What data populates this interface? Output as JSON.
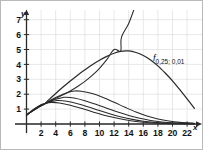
{
  "figure": {
    "title": "",
    "axis": {
      "y_label": "y",
      "x_label": "x"
    },
    "curve_label": {
      "symbol": "f",
      "subscript": "0,25; 0,01",
      "full": "f0,25; 0,01"
    }
  },
  "chart_data": {
    "type": "line",
    "title": "",
    "xlabel": "x",
    "ylabel": "y",
    "xlim": [
      -1.2,
      23.5
    ],
    "ylim": [
      -0.55,
      7.8
    ],
    "xticks": [
      2,
      4,
      6,
      8,
      10,
      12,
      14,
      16,
      18,
      20,
      22
    ],
    "yticks": [
      1,
      2,
      3,
      4,
      5,
      6,
      7
    ],
    "xtick_labels": [
      "2",
      "4",
      "6",
      "8",
      "10",
      "12",
      "14",
      "16",
      "18",
      "20",
      "22"
    ],
    "ytick_labels": [
      "1",
      "2",
      "3",
      "4",
      "5",
      "6",
      "7"
    ],
    "grid": true,
    "grid_color": "#d8d8d8",
    "grid_x_step": 2,
    "grid_y_step": 1,
    "axis_color": "#2a2a2a",
    "curve_color": "#2a2a2a",
    "legend": "none",
    "annotations": [
      {
        "text": "f0,25; 0,01",
        "x": 16.6,
        "y": 4.35
      }
    ],
    "common_point": {
      "x": 2.4,
      "y": 1.32
    },
    "series": [
      {
        "name": "f0,25; 0,01",
        "labeled": true,
        "peak": {
          "x": 12.9,
          "y": 4.88
        },
        "points": [
          [
            0.0,
            0.6
          ],
          [
            0.6,
            0.8
          ],
          [
            1.2,
            0.99
          ],
          [
            1.8,
            1.17
          ],
          [
            2.4,
            1.32
          ],
          [
            3.0,
            1.6
          ],
          [
            4.0,
            2.05
          ],
          [
            5.0,
            2.48
          ],
          [
            6.0,
            2.89
          ],
          [
            7.0,
            3.28
          ],
          [
            8.0,
            3.64
          ],
          [
            9.0,
            3.98
          ],
          [
            10.0,
            4.28
          ],
          [
            11.0,
            4.54
          ],
          [
            12.0,
            4.75
          ],
          [
            12.9,
            4.88
          ],
          [
            14.0,
            4.9
          ],
          [
            15.0,
            4.8
          ],
          [
            16.0,
            4.6
          ],
          [
            17.0,
            4.3
          ],
          [
            18.0,
            3.9
          ],
          [
            19.0,
            3.42
          ],
          [
            20.0,
            2.9
          ],
          [
            21.0,
            2.3
          ],
          [
            22.0,
            1.68
          ],
          [
            23.0,
            1.05
          ]
        ]
      },
      {
        "name": "steeply-rising-curve",
        "labeled": false,
        "peak": null,
        "points": [
          [
            0.0,
            0.6
          ],
          [
            1.0,
            0.93
          ],
          [
            2.0,
            1.22
          ],
          [
            2.4,
            1.32
          ],
          [
            3.0,
            1.48
          ],
          [
            4.0,
            1.72
          ],
          [
            5.0,
            1.96
          ],
          [
            6.0,
            2.22
          ],
          [
            7.0,
            2.52
          ],
          [
            8.0,
            2.86
          ],
          [
            9.0,
            3.26
          ],
          [
            10.0,
            3.74
          ],
          [
            11.0,
            4.32
          ],
          [
            12.0,
            5.0
          ],
          [
            12.9,
            4.9
          ],
          [
            13.0,
            5.8
          ],
          [
            14.0,
            6.75
          ],
          [
            14.8,
            7.8
          ]
        ]
      },
      {
        "name": "curve-peak-2_2",
        "labeled": false,
        "peak": {
          "x": 6.6,
          "y": 2.22
        },
        "points": [
          [
            0.0,
            0.6
          ],
          [
            1.0,
            0.95
          ],
          [
            2.0,
            1.24
          ],
          [
            2.4,
            1.32
          ],
          [
            3.0,
            1.52
          ],
          [
            4.0,
            1.78
          ],
          [
            5.0,
            2.0
          ],
          [
            6.0,
            2.16
          ],
          [
            6.6,
            2.22
          ],
          [
            7.5,
            2.2
          ],
          [
            9.0,
            2.04
          ],
          [
            10.5,
            1.78
          ],
          [
            12.0,
            1.46
          ],
          [
            13.5,
            1.12
          ],
          [
            15.0,
            0.8
          ],
          [
            16.5,
            0.54
          ],
          [
            18.0,
            0.34
          ],
          [
            19.5,
            0.2
          ],
          [
            21.0,
            0.11
          ],
          [
            23.0,
            0.05
          ]
        ]
      },
      {
        "name": "curve-peak-1_8",
        "labeled": false,
        "peak": {
          "x": 5.4,
          "y": 1.8
        },
        "points": [
          [
            0.0,
            0.6
          ],
          [
            1.0,
            0.96
          ],
          [
            2.0,
            1.26
          ],
          [
            2.4,
            1.32
          ],
          [
            3.0,
            1.48
          ],
          [
            4.0,
            1.66
          ],
          [
            5.0,
            1.78
          ],
          [
            5.4,
            1.8
          ],
          [
            6.5,
            1.74
          ],
          [
            8.0,
            1.56
          ],
          [
            9.5,
            1.32
          ],
          [
            11.0,
            1.06
          ],
          [
            12.5,
            0.8
          ],
          [
            14.0,
            0.57
          ],
          [
            15.5,
            0.38
          ],
          [
            17.0,
            0.24
          ],
          [
            18.5,
            0.14
          ],
          [
            20.0,
            0.08
          ],
          [
            23.0,
            0.02
          ]
        ]
      },
      {
        "name": "curve-peak-1_6",
        "labeled": false,
        "peak": {
          "x": 4.4,
          "y": 1.58
        },
        "points": [
          [
            0.0,
            0.6
          ],
          [
            1.0,
            0.98
          ],
          [
            2.0,
            1.28
          ],
          [
            2.4,
            1.34
          ],
          [
            3.0,
            1.45
          ],
          [
            4.0,
            1.56
          ],
          [
            4.4,
            1.58
          ],
          [
            5.5,
            1.52
          ],
          [
            7.0,
            1.36
          ],
          [
            8.5,
            1.14
          ],
          [
            10.0,
            0.9
          ],
          [
            11.5,
            0.67
          ],
          [
            13.0,
            0.47
          ],
          [
            14.5,
            0.31
          ],
          [
            16.0,
            0.19
          ],
          [
            17.5,
            0.11
          ],
          [
            19.0,
            0.06
          ],
          [
            23.0,
            0.01
          ]
        ]
      },
      {
        "name": "curve-peak-1_45",
        "labeled": false,
        "peak": {
          "x": 3.5,
          "y": 1.45
        },
        "points": [
          [
            0.0,
            0.6
          ],
          [
            1.0,
            1.0
          ],
          [
            2.0,
            1.3
          ],
          [
            2.4,
            1.36
          ],
          [
            3.0,
            1.43
          ],
          [
            3.5,
            1.45
          ],
          [
            4.5,
            1.41
          ],
          [
            6.0,
            1.26
          ],
          [
            7.5,
            1.05
          ],
          [
            9.0,
            0.83
          ],
          [
            10.5,
            0.61
          ],
          [
            12.0,
            0.43
          ],
          [
            13.5,
            0.28
          ],
          [
            15.0,
            0.17
          ],
          [
            16.5,
            0.1
          ],
          [
            18.0,
            0.05
          ],
          [
            23.0,
            0.0
          ]
        ]
      }
    ]
  }
}
